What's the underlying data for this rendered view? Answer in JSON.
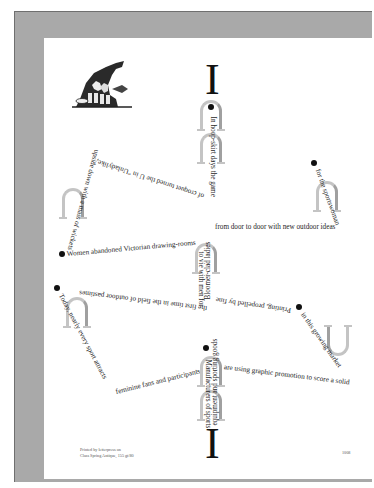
{
  "artwork": {
    "title_glyph_top": "I",
    "title_glyph_bottom": "I",
    "woodcut": "woodcut-illustration-of-figures",
    "text_paths": [
      {
        "id": "hoop-skirt",
        "text": "In hoop-skirt days the game"
      },
      {
        "id": "croquet",
        "text": "of croquet turned the U in \"Unladylike,\""
      },
      {
        "id": "upside-down",
        "text": "upside down with a mass of wickets"
      },
      {
        "id": "women-abandoned",
        "text": "Women abandoned Victorian drawing-rooms"
      },
      {
        "id": "bloomer",
        "text": "Bloomer-clad ladies"
      },
      {
        "id": "vie-with-men",
        "text": "to vie with men for"
      },
      {
        "id": "door-to-door",
        "text": "from door to door with new outdoor ideas"
      },
      {
        "id": "sportswoman",
        "text": "for the sportswoman"
      },
      {
        "id": "first-time",
        "text": "the first time in the field of outdoor pastimes"
      },
      {
        "id": "printing",
        "text": "Printing, propelled by fine"
      },
      {
        "id": "growing-market",
        "text": "in this growing market"
      },
      {
        "id": "today",
        "text": "Today, nearly every sport attracts"
      },
      {
        "id": "feminine-fans",
        "text": "feminine fans and participants"
      },
      {
        "id": "graphic-promotion",
        "text": "are using graphic promotion to score a solid"
      },
      {
        "id": "manufacturers",
        "text": "Manufacturers of sports"
      },
      {
        "id": "equipment",
        "text": "equipment and sporting goods"
      }
    ]
  },
  "footer": {
    "colophon_line1": "Printed by letterpress on",
    "colophon_line2": "Class Spring Antique, 155 gt/80",
    "page_mark": "1008"
  },
  "colors": {
    "frame": "#a9a9a9",
    "page": "#ffffff",
    "ink": "#1e1e1e",
    "arch_gray": "#c4c4c4"
  }
}
